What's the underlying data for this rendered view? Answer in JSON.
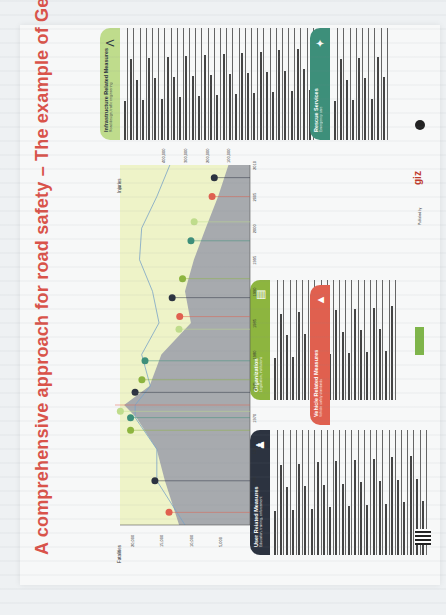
{
  "poster": {
    "title": "A comprehensive approach for road safety – The example of Germany",
    "published_by_label": "Published by",
    "logo_giz": "giz",
    "colors": {
      "title": "#d9534a",
      "user": "#2c3340",
      "organization": "#8db53f",
      "vehicle": "#e0604f",
      "infrastructure": "#bfdc8c",
      "rescue": "#3d8f7a",
      "chart_area": "#a7aaae",
      "chart_bg": "#eef3c8"
    }
  },
  "panels": {
    "user": {
      "title": "User Related Measures",
      "subtitle": "Education, training, enforcement",
      "icon": "people-icon",
      "rows": [
        "",
        "",
        "",
        "",
        "",
        "",
        "",
        "",
        "",
        "",
        "",
        "",
        "",
        "",
        "",
        "",
        "",
        "",
        "",
        "",
        "",
        "",
        "",
        "",
        ""
      ]
    },
    "organization": {
      "title": "Organization",
      "subtitle": "Legislation, institutions",
      "icon": "document-icon",
      "rows": [
        "",
        "",
        "",
        "",
        "",
        "",
        "",
        "",
        "",
        "",
        "",
        "",
        "",
        "",
        "",
        "",
        "",
        "",
        "",
        ""
      ]
    },
    "vehicle": {
      "title": "Vehicle Related Measures",
      "subtitle": "Vehicle safety standards",
      "icon": "car-crash-icon",
      "rows": [
        "",
        "",
        "",
        "",
        "",
        "",
        "",
        "",
        "",
        "",
        ""
      ]
    },
    "infrastructure": {
      "title": "Infrastructure Related Measures",
      "subtitle": "Road design, traffic engineering",
      "icon": "road-icon",
      "rows": [
        "",
        "",
        "",
        "",
        "",
        "",
        "",
        "",
        "",
        "",
        "",
        "",
        "",
        "",
        "",
        "",
        "",
        "",
        "",
        "",
        "",
        "",
        "",
        "",
        "",
        "",
        "",
        "",
        "",
        "",
        ""
      ]
    },
    "rescue": {
      "title": "Rescue Services",
      "subtitle": "Emergency care",
      "icon": "siren-icon",
      "rows": [
        "",
        "",
        "",
        "",
        "",
        "",
        "",
        "",
        ""
      ]
    }
  },
  "chart_data": {
    "type": "area",
    "xlabel": "Year",
    "ylabel_left": "Fatalities",
    "ylabel_right": "Injuries",
    "x": [
      1953,
      1960,
      1965,
      1970,
      1972,
      1975,
      1980,
      1985,
      1990,
      1995,
      2000,
      2005,
      2010
    ],
    "x_ticks": [
      "1953",
      "1960",
      "1965",
      "1970",
      "1975",
      "1980",
      "1985",
      "1990",
      "1995",
      "2000",
      "2005",
      "2010"
    ],
    "series": [
      {
        "name": "Fatalities",
        "values": [
          12000,
          14400,
          15800,
          19200,
          21300,
          17000,
          15000,
          10000,
          11000,
          9500,
          7500,
          5400,
          3650
        ]
      },
      {
        "name": "Injuries",
        "values": [
          300000,
          430000,
          430000,
          530000,
          530000,
          460000,
          500000,
          420000,
          450000,
          510000,
          500000,
          430000,
          370000
        ]
      }
    ],
    "fatalities_ticks": [
      "5,000",
      "10,000",
      "15,000",
      "20,000"
    ],
    "injuries_ticks": [
      "100,000",
      "200,000",
      "300,000",
      "400,000"
    ],
    "ylim_fatalities": [
      0,
      22000
    ],
    "grid": false,
    "legend_position": "axis-labels"
  }
}
